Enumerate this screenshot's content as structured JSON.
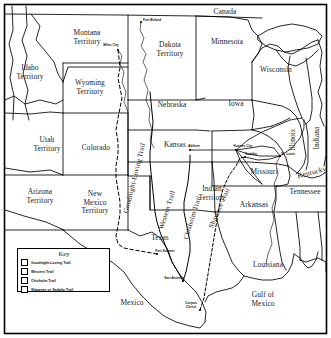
{
  "map": {
    "title": "Cattle Trails of the American West",
    "frame_color": "#000000",
    "background_color": "#ffffff",
    "regions": [
      {
        "name": "idaho-territory",
        "label": "Idaho\nTerritory",
        "x": 30,
        "y": 73
      },
      {
        "name": "montana-territory",
        "label": "Montana\nTerritory",
        "x": 87,
        "y": 38
      },
      {
        "name": "wyoming-territory",
        "label": "Wyoming\nTerritory",
        "x": 90,
        "y": 88
      },
      {
        "name": "utah-territory",
        "label": "Utah\nTerritory",
        "x": 47,
        "y": 145
      },
      {
        "name": "colorado",
        "label": "Colorado",
        "x": 96,
        "y": 148
      },
      {
        "name": "arizona-territory",
        "label": "Arizona\nTerritory",
        "x": 40,
        "y": 197
      },
      {
        "name": "new-mexico-territory",
        "label": "New\nMexico\nTerritory",
        "x": 95,
        "y": 203
      },
      {
        "name": "dakota-territory",
        "label": "Dakota\nTerritory",
        "x": 170,
        "y": 50
      },
      {
        "name": "nebraska",
        "label": "Nebraska",
        "x": 172,
        "y": 105
      },
      {
        "name": "kansas",
        "label": "Kansas",
        "x": 175,
        "y": 145
      },
      {
        "name": "indian-territory",
        "label": "Indian\nTerritory",
        "x": 212,
        "y": 194
      },
      {
        "name": "texas",
        "label": "Texas",
        "x": 160,
        "y": 238
      },
      {
        "name": "minnesota",
        "label": "Minnesota",
        "x": 227,
        "y": 42
      },
      {
        "name": "iowa",
        "label": "Iowa",
        "x": 236,
        "y": 104
      },
      {
        "name": "wisconsin",
        "label": "Wisconsin",
        "x": 276,
        "y": 70
      },
      {
        "name": "illinois",
        "label": "Illinois",
        "x": 293,
        "y": 140
      },
      {
        "name": "indiana",
        "label": "Indiana",
        "x": 317,
        "y": 138
      },
      {
        "name": "missouri",
        "label": "Missouri",
        "x": 264,
        "y": 172
      },
      {
        "name": "arkansas",
        "label": "Arkansas",
        "x": 254,
        "y": 205
      },
      {
        "name": "kentucky",
        "label": "Kentucky",
        "x": 312,
        "y": 173
      },
      {
        "name": "tennessee",
        "label": "Tennessee",
        "x": 305,
        "y": 192
      },
      {
        "name": "louisiana",
        "label": "Louisiana",
        "x": 268,
        "y": 265
      },
      {
        "name": "canada",
        "label": "Canada",
        "x": 225,
        "y": 12
      },
      {
        "name": "mexico",
        "label": "Mexico",
        "x": 132,
        "y": 303
      },
      {
        "name": "gulf-of-mexico",
        "label": "Gulf of\nMexico",
        "x": 263,
        "y": 300
      }
    ],
    "cities": [
      {
        "name": "fort-buford",
        "label": "Fort Buford",
        "x": 145,
        "y": 21,
        "dot_x": 141,
        "dot_y": 22
      },
      {
        "name": "miles-city",
        "label": "Miles City",
        "x": 113,
        "y": 47,
        "dot_x": 118,
        "dot_y": 50
      },
      {
        "name": "kansas-city",
        "label": "Kansas City",
        "x": 241,
        "y": 148,
        "dot_x": 236,
        "dot_y": 150
      },
      {
        "name": "sedalia",
        "label": "Sedalia",
        "x": 249,
        "y": 156,
        "dot_x": 245,
        "dot_y": 157
      },
      {
        "name": "st-louis",
        "label": "St. Louis",
        "x": 285,
        "y": 155,
        "dot_x": 280,
        "dot_y": 156
      },
      {
        "name": "abilene",
        "label": "Abilene",
        "x": 194,
        "y": 148,
        "dot_x": 190,
        "dot_y": 150
      },
      {
        "name": "fort-sumner",
        "label": "Fort Sumner",
        "x": 163,
        "y": 253,
        "dot_x": 157,
        "dot_y": 254
      },
      {
        "name": "san-antonio",
        "label": "San Antonio",
        "x": 178,
        "y": 280,
        "dot_x": 183,
        "dot_y": 281
      },
      {
        "name": "corpus-christi",
        "label": "Corpus\nChristi",
        "x": 193,
        "y": 307,
        "dot_x": 200,
        "dot_y": 310
      }
    ],
    "trail_labels": [
      {
        "name": "goodnight-loving-trail",
        "label": "Goodnight-Loving Trail",
        "x": 122,
        "y": 210,
        "rotate": -76
      },
      {
        "name": "western-trail",
        "label": "Western Trail",
        "x": 158,
        "y": 230,
        "rotate": -72
      },
      {
        "name": "chisholm-trail",
        "label": "Chisholm Trail",
        "x": 183,
        "y": 240,
        "rotate": -73
      },
      {
        "name": "shawnee-trail",
        "label": "Shawnee Trail",
        "x": 208,
        "y": 228,
        "rotate": -66
      }
    ]
  },
  "legend": {
    "title": "Key",
    "items": [
      {
        "name": "goodnight-loving-trail",
        "label": "Goodnight-Loving Trail"
      },
      {
        "name": "western-trail",
        "label": "Western Trail"
      },
      {
        "name": "chisholm-trail",
        "label": "Chisholm Trail"
      },
      {
        "name": "shawnee-or-sedalia-trail",
        "label": "Shawnee or Sedalia Trail"
      }
    ]
  }
}
